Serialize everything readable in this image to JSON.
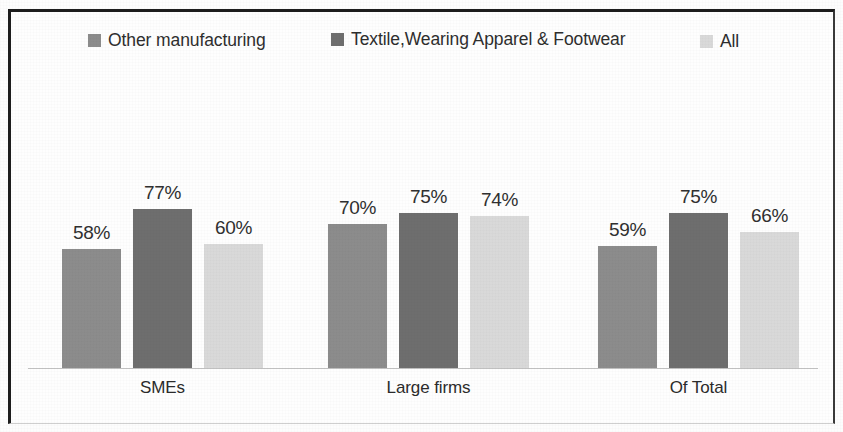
{
  "figure": {
    "background_color": "#fdfdfd",
    "frame_color": "#1d1d1d"
  },
  "legend": {
    "position": "top",
    "entries": [
      {
        "label": "Other manufacturing",
        "color": "#8c8c8c",
        "swatch_name": "legend-swatch-other-manufacturing"
      },
      {
        "label": "Textile,Wearing Apparel & Footwear",
        "color": "#6e6e6e",
        "swatch_name": "legend-swatch-textile-wearing-apparel-footwear"
      },
      {
        "label": "All",
        "color": "#d9d9d9",
        "swatch_name": "legend-swatch-all"
      }
    ]
  },
  "axis": {
    "baseline_color": "#c2c2c2",
    "categories": [
      "SMEs",
      "Large firms",
      "Of Total"
    ]
  },
  "chart_data": {
    "type": "bar",
    "title": "",
    "subtitle": "",
    "xlabel": "",
    "ylabel": "",
    "ylim": [
      0,
      100
    ],
    "grid": false,
    "legend_position": "top",
    "value_suffix": "%",
    "categories": [
      "SMEs",
      "Large firms",
      "Of Total"
    ],
    "series": [
      {
        "name": "Other manufacturing",
        "color": "#8c8c8c",
        "values": [
          58,
          70,
          59
        ],
        "labels": [
          "58%",
          "70%",
          "59%"
        ]
      },
      {
        "name": "Textile,Wearing Apparel & Footwear",
        "color": "#6e6e6e",
        "values": [
          77,
          75,
          75
        ],
        "labels": [
          "77%",
          "75%",
          "75%"
        ]
      },
      {
        "name": "All",
        "color": "#d9d9d9",
        "values": [
          60,
          74,
          66
        ],
        "labels": [
          "60%",
          "74%",
          "66%"
        ]
      }
    ],
    "bars_in_draw_order": [
      {
        "group": "SMEs",
        "series": "Other manufacturing",
        "value": 58,
        "label": "58%",
        "color": "#8c8c8c"
      },
      {
        "group": "SMEs",
        "series": "Textile,Wearing Apparel & Footwear",
        "value": 70,
        "label": "70%",
        "color": "#6e6e6e"
      },
      {
        "group": "SMEs",
        "series": "All",
        "value": 59,
        "label": "59%",
        "color": "#d9d9d9"
      },
      {
        "group": "Large firms",
        "series": "Other manufacturing",
        "value": 77,
        "label": "77%",
        "color": "#8c8c8c"
      },
      {
        "group": "Large firms",
        "series": "Textile,Wearing Apparel & Footwear",
        "value": 75,
        "label": "75%",
        "color": "#6e6e6e"
      },
      {
        "group": "Large firms",
        "series": "All",
        "value": 75,
        "label": "75%",
        "color": "#d9d9d9"
      },
      {
        "group": "Of Total",
        "series": "Other manufacturing",
        "value": 60,
        "label": "60%",
        "color": "#8c8c8c"
      },
      {
        "group": "Of Total",
        "series": "Textile,Wearing Apparel & Footwear",
        "value": 74,
        "label": "74%",
        "color": "#6e6e6e"
      },
      {
        "group": "Of Total",
        "series": "All",
        "value": 66,
        "label": "66%",
        "color": "#d9d9d9"
      }
    ]
  },
  "layout": {
    "baseline_y": 368,
    "bar_width": 59,
    "px_per_unit": 2.06,
    "group_x": [
      62,
      328,
      598
    ],
    "bar_step": 71
  }
}
